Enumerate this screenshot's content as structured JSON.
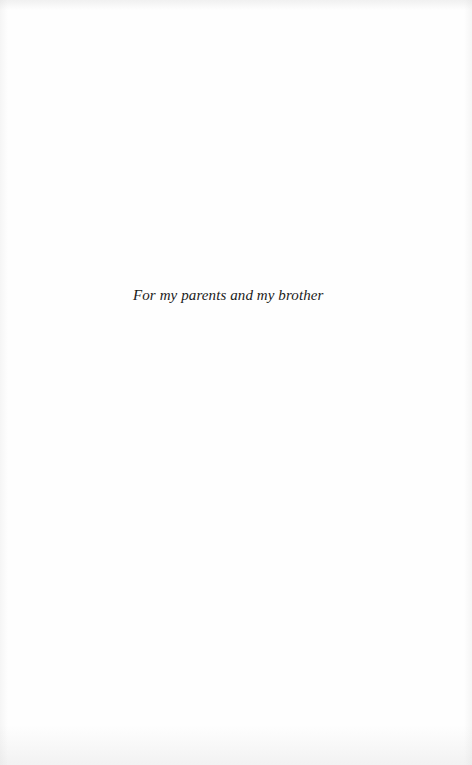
{
  "page": {
    "background_color": "#fefefe",
    "text_color": "#1a1a1a"
  },
  "dedication": {
    "text": "For my parents and my brother"
  }
}
